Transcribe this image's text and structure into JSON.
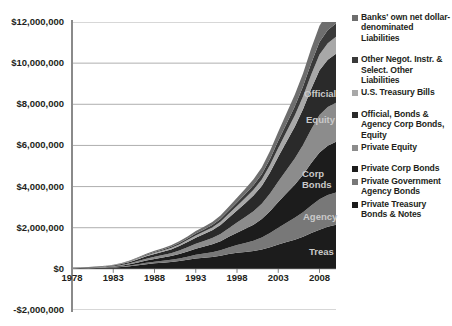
{
  "chart_data": {
    "type": "area",
    "title": "",
    "xlabel": "",
    "ylabel": "",
    "stacked": true,
    "grid": true,
    "legend_position": "right",
    "ylim": [
      -2000000,
      12000000
    ],
    "xlim": [
      1978,
      2010
    ],
    "ytick_labels": [
      "$12,000,000",
      "$10,000,000",
      "$8,000,000",
      "$6,000,000",
      "$4,000,000",
      "$2,000,000",
      "$0",
      "-$2,000,000"
    ],
    "ytick_values": [
      12000000,
      10000000,
      8000000,
      6000000,
      4000000,
      2000000,
      0,
      -2000000
    ],
    "xtick_labels": [
      "1978",
      "1983",
      "1988",
      "1993",
      "1998",
      "2003",
      "2008"
    ],
    "xtick_values": [
      1978,
      1983,
      1988,
      1993,
      1998,
      2003,
      2008
    ],
    "x": [
      1978,
      1979,
      1980,
      1981,
      1982,
      1983,
      1984,
      1985,
      1986,
      1987,
      1988,
      1989,
      1990,
      1991,
      1992,
      1993,
      1994,
      1995,
      1996,
      1997,
      1998,
      1999,
      2000,
      2001,
      2002,
      2003,
      2004,
      2005,
      2006,
      2007,
      2008,
      2009,
      2010
    ],
    "series": [
      {
        "name": "Private Treasury Bonds & Notes",
        "color": "#1c1c1c",
        "inplot_label": "Treas",
        "values": [
          20000,
          24000,
          30000,
          38000,
          48000,
          62000,
          90000,
          130000,
          180000,
          230000,
          270000,
          300000,
          330000,
          380000,
          440000,
          500000,
          540000,
          580000,
          640000,
          720000,
          780000,
          820000,
          870000,
          940000,
          1050000,
          1180000,
          1300000,
          1420000,
          1560000,
          1740000,
          1900000,
          2050000,
          2150000
        ]
      },
      {
        "name": "Private Government Agency Bonds",
        "color": "#787878",
        "inplot_label": "Agency",
        "values": [
          5000,
          6000,
          8000,
          10000,
          13000,
          17000,
          24000,
          34000,
          48000,
          64000,
          78000,
          92000,
          108000,
          128000,
          152000,
          180000,
          205000,
          232000,
          268000,
          320000,
          380000,
          440000,
          500000,
          580000,
          690000,
          820000,
          940000,
          1060000,
          1190000,
          1340000,
          1480000,
          1540000,
          1560000
        ]
      },
      {
        "name": "Private Corp Bonds",
        "color": "#1c1c1c",
        "inplot_label": "Corp Bonds",
        "values": [
          8000,
          10000,
          13000,
          17000,
          22000,
          29000,
          42000,
          60000,
          85000,
          112000,
          135000,
          158000,
          182000,
          215000,
          255000,
          300000,
          340000,
          382000,
          440000,
          520000,
          600000,
          690000,
          780000,
          900000,
          1060000,
          1250000,
          1430000,
          1610000,
          1820000,
          2060000,
          2280000,
          2400000,
          2470000
        ]
      },
      {
        "name": "Private Equity",
        "color": "#8c8c8c",
        "inplot_label": "Equity",
        "values": [
          6000,
          8000,
          10000,
          13000,
          17000,
          22000,
          32000,
          46000,
          65000,
          86000,
          104000,
          122000,
          142000,
          168000,
          200000,
          236000,
          268000,
          302000,
          350000,
          416000,
          490000,
          570000,
          650000,
          740000,
          860000,
          1000000,
          1140000,
          1280000,
          1450000,
          1650000,
          1820000,
          1880000,
          1900000
        ]
      },
      {
        "name": "Official, Bonds & Agency Corp Bonds, Equity",
        "color": "#2a2a2a",
        "inplot_label": "Official",
        "values": [
          10000,
          12000,
          15000,
          19000,
          25000,
          32000,
          45000,
          63000,
          88000,
          115000,
          138000,
          160000,
          184000,
          216000,
          255000,
          298000,
          336000,
          376000,
          432000,
          508000,
          588000,
          672000,
          760000,
          870000,
          1020000,
          1200000,
          1370000,
          1540000,
          1740000,
          1970000,
          2180000,
          2300000,
          2380000
        ]
      },
      {
        "name": "U.S. Treasury Bills",
        "color": "#a8a8a8",
        "inplot_label": "",
        "values": [
          4000,
          5000,
          6000,
          8000,
          10000,
          13000,
          18000,
          25000,
          34000,
          44000,
          53000,
          62000,
          71000,
          83000,
          97000,
          113000,
          127000,
          142000,
          162000,
          190000,
          218000,
          248000,
          280000,
          318000,
          370000,
          430000,
          488000,
          546000,
          614000,
          692000,
          760000,
          800000,
          820000
        ]
      },
      {
        "name": "Other Negot. Instr. & Select. Other Liabilities",
        "color": "#3a3a3a",
        "inplot_label": "",
        "values": [
          3000,
          4000,
          5000,
          6000,
          8000,
          10000,
          14000,
          20000,
          27000,
          35000,
          42000,
          49000,
          56000,
          66000,
          77000,
          90000,
          101000,
          113000,
          129000,
          151000,
          174000,
          198000,
          223000,
          253000,
          294000,
          342000,
          388000,
          434000,
          488000,
          550000,
          604000,
          636000,
          652000
        ]
      },
      {
        "name": "Banks' own net dollar-denominated Liabilities",
        "color": "#6e6e6e",
        "inplot_label": "",
        "values": [
          4000,
          5000,
          6000,
          8000,
          10000,
          13000,
          18000,
          26000,
          35000,
          46000,
          55000,
          64000,
          74000,
          86000,
          101000,
          118000,
          132000,
          148000,
          169000,
          198000,
          228000,
          260000,
          293000,
          332000,
          386000,
          448000,
          509000,
          570000,
          640000,
          722000,
          793000,
          834000,
          856000
        ]
      }
    ],
    "inplot_labels": [
      {
        "text": "Official",
        "x_px": 304,
        "y_px": 88
      },
      {
        "text": "Equity",
        "x_px": 306,
        "y_px": 114
      },
      {
        "text": "Corp Bonds",
        "x_px": 302,
        "y_px": 168
      },
      {
        "text": "Agency",
        "x_px": 303,
        "y_px": 211
      },
      {
        "text": "Treas",
        "x_px": 309,
        "y_px": 246
      }
    ],
    "legend_entries": [
      {
        "label": "Banks' own net dollar-denominated Liabilities",
        "color": "#6e6e6e",
        "gap_after": true
      },
      {
        "label": "Other Negot. Instr. & Select. Other Liabilities",
        "color": "#3a3a3a",
        "gap_after": false
      },
      {
        "label": "U.S. Treasury Bills",
        "color": "#a8a8a8",
        "gap_after": true
      },
      {
        "label": "Official, Bonds & Agency Corp Bonds, Equity",
        "color": "#2a2a2a",
        "gap_after": false
      },
      {
        "label": "Private Equity",
        "color": "#8c8c8c",
        "gap_after": true
      },
      {
        "label": "Private Corp Bonds",
        "color": "#1c1c1c",
        "gap_after": false
      },
      {
        "label": "Private Government Agency Bonds",
        "color": "#787878",
        "gap_after": false
      },
      {
        "label": "Private Treasury Bonds & Notes",
        "color": "#1c1c1c",
        "gap_after": false
      }
    ],
    "colors": {
      "background": "#ffffff",
      "axis": "#808080",
      "grid": "#a6a6a6",
      "text": "#231f20",
      "inplot_label_text": "#c9c9c9"
    }
  }
}
